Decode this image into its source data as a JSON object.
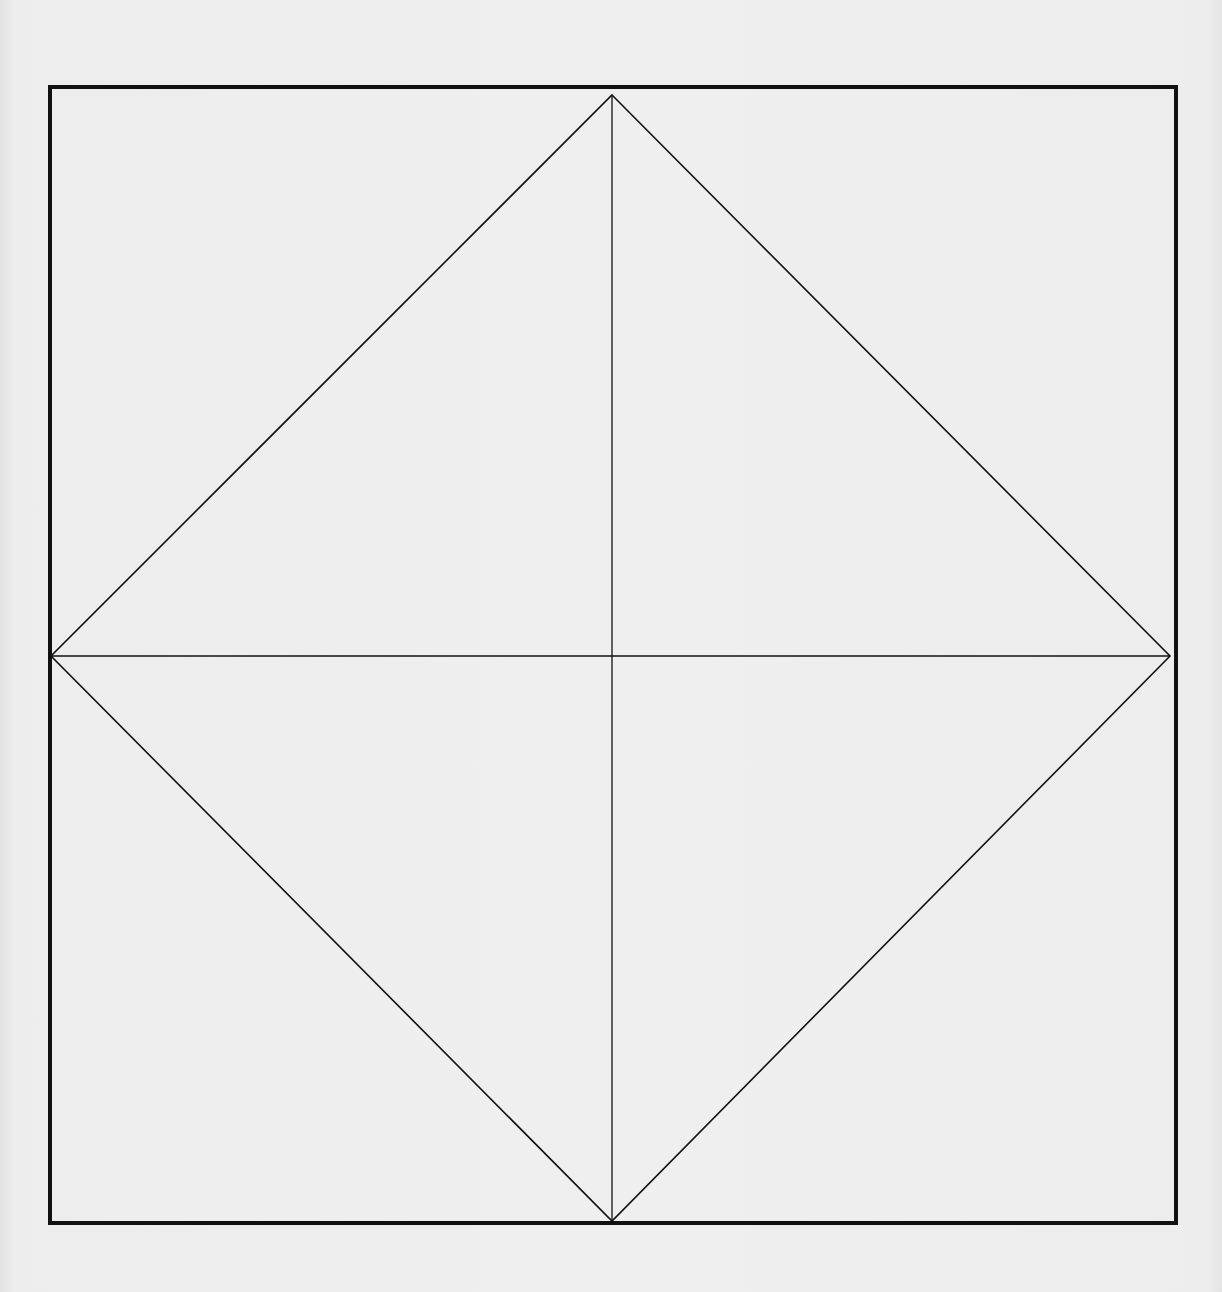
{
  "diagram": {
    "title": "",
    "colors": {
      "background": "#ececec",
      "stroke": "#111111"
    },
    "outer_square": {
      "x1": 50,
      "y1": 87,
      "x2": 1176,
      "y2": 1223,
      "stroke_width": 4
    },
    "diamond": {
      "top": [
        612,
        95
      ],
      "right": [
        1170,
        656
      ],
      "bottom": [
        612,
        1221
      ],
      "left": [
        51,
        656
      ],
      "stroke_width": 1.6
    },
    "center_lines": {
      "horizontal": {
        "y": 656,
        "x1": 51,
        "x2": 1170
      },
      "vertical": {
        "x": 612,
        "y1": 95,
        "y2": 1221
      },
      "stroke_width": 1.3
    }
  }
}
